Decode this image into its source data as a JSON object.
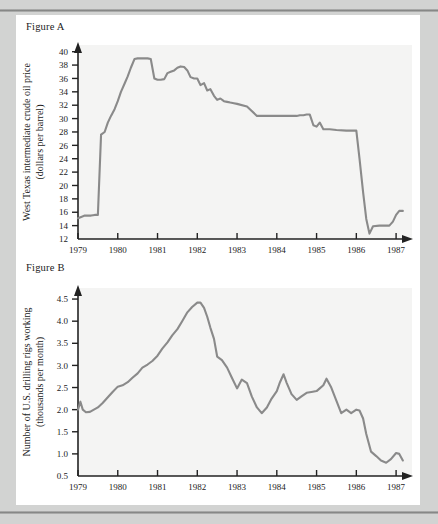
{
  "page": {
    "background_color": "#d2d3d2",
    "card_color": "#ffffff",
    "rule_color": "#8f908f"
  },
  "figures": [
    {
      "label": "Figure A",
      "ylabel_line1": "West Texas intermediate crude oil price",
      "ylabel_line2": "(dollars per barrel)"
    },
    {
      "label": "Figure B",
      "ylabel_line1": "Number of U.S. drilling rigs working",
      "ylabel_line2": "(thousands per month)"
    }
  ],
  "chart_data": [
    {
      "type": "line",
      "title": "Figure A",
      "xlabel": "",
      "ylabel": "West Texas intermediate crude oil price (dollars per barrel)",
      "series_color": "#8a8a8a",
      "grid": false,
      "legend": "none",
      "xlim": [
        1979.0,
        1987.4
      ],
      "ylim": [
        12,
        41
      ],
      "xticks": [
        "1979",
        "1980",
        "1981",
        "1982",
        "1983",
        "1984",
        "1985",
        "1986",
        "1987"
      ],
      "xtick_values": [
        1979,
        1980,
        1981,
        1982,
        1983,
        1984,
        1985,
        1986,
        1987
      ],
      "yticks": [
        "12",
        "14",
        "16",
        "18",
        "20",
        "22",
        "24",
        "26",
        "28",
        "30",
        "32",
        "34",
        "36",
        "38",
        "40"
      ],
      "ytick_values": [
        12,
        14,
        16,
        18,
        20,
        22,
        24,
        26,
        28,
        30,
        32,
        34,
        36,
        38,
        40
      ],
      "x": [
        1979.0,
        1979.08,
        1979.17,
        1979.25,
        1979.33,
        1979.42,
        1979.5,
        1979.58,
        1979.67,
        1979.75,
        1979.83,
        1979.92,
        1980.0,
        1980.08,
        1980.17,
        1980.25,
        1980.33,
        1980.42,
        1980.5,
        1980.58,
        1980.67,
        1980.75,
        1980.83,
        1980.92,
        1981.0,
        1981.08,
        1981.17,
        1981.25,
        1981.33,
        1981.42,
        1981.5,
        1981.58,
        1981.67,
        1981.75,
        1981.83,
        1981.92,
        1982.0,
        1982.08,
        1982.17,
        1982.25,
        1982.33,
        1982.42,
        1982.5,
        1982.58,
        1982.67,
        1982.75,
        1982.83,
        1982.92,
        1983.0,
        1983.25,
        1983.5,
        1983.75,
        1984.0,
        1984.25,
        1984.5,
        1984.58,
        1984.67,
        1984.75,
        1984.83,
        1984.92,
        1985.0,
        1985.08,
        1985.17,
        1985.33,
        1985.5,
        1985.75,
        1986.0,
        1986.08,
        1986.17,
        1986.25,
        1986.33,
        1986.42,
        1986.58,
        1986.75,
        1986.83,
        1986.92,
        1987.0,
        1987.08,
        1987.17
      ],
      "y": [
        15.1,
        15.3,
        15.5,
        15.5,
        15.5,
        15.6,
        15.6,
        27.6,
        28.0,
        29.4,
        30.4,
        31.4,
        32.6,
        34.0,
        35.2,
        36.3,
        37.6,
        38.9,
        39.0,
        39.0,
        39.0,
        39.0,
        38.9,
        36.0,
        35.8,
        35.8,
        35.9,
        36.8,
        37.0,
        37.2,
        37.6,
        37.8,
        37.7,
        37.2,
        36.2,
        36.0,
        36.0,
        35.0,
        35.3,
        34.2,
        34.4,
        33.4,
        32.8,
        33.0,
        32.6,
        32.5,
        32.4,
        32.3,
        32.2,
        31.8,
        30.4,
        30.4,
        30.4,
        30.4,
        30.4,
        30.5,
        30.5,
        30.6,
        30.6,
        29.0,
        28.8,
        29.4,
        28.4,
        28.4,
        28.3,
        28.2,
        28.2,
        24.0,
        19.0,
        15.0,
        12.8,
        13.9,
        14.0,
        14.0,
        14.0,
        14.6,
        15.6,
        16.2,
        16.2
      ]
    },
    {
      "type": "line",
      "title": "Figure B",
      "xlabel": "",
      "ylabel": "Number of U.S. drilling rigs working (thousands per month)",
      "series_color": "#8a8a8a",
      "grid": false,
      "legend": "none",
      "xlim": [
        1979.0,
        1987.4
      ],
      "ylim": [
        0.5,
        4.75
      ],
      "xticks": [
        "1979",
        "1980",
        "1981",
        "1982",
        "1983",
        "1984",
        "1985",
        "1986",
        "1987"
      ],
      "xtick_values": [
        1979,
        1980,
        1981,
        1982,
        1983,
        1984,
        1985,
        1986,
        1987
      ],
      "yticks": [
        "0.5",
        "1.0",
        "1.5",
        "2.0",
        "2.5",
        "3.0",
        "3.5",
        "4.0",
        "4.5"
      ],
      "ytick_values": [
        0.5,
        1.0,
        1.5,
        2.0,
        2.5,
        3.0,
        3.5,
        4.0,
        4.5
      ],
      "x": [
        1979.0,
        1979.06,
        1979.12,
        1979.2,
        1979.3,
        1979.4,
        1979.5,
        1979.62,
        1979.75,
        1979.87,
        1980.0,
        1980.12,
        1980.25,
        1980.37,
        1980.5,
        1980.62,
        1980.75,
        1980.87,
        1981.0,
        1981.12,
        1981.25,
        1981.37,
        1981.5,
        1981.62,
        1981.75,
        1981.87,
        1982.0,
        1982.08,
        1982.17,
        1982.25,
        1982.33,
        1982.42,
        1982.5,
        1982.62,
        1982.75,
        1982.87,
        1983.0,
        1983.12,
        1983.25,
        1983.37,
        1983.5,
        1983.62,
        1983.75,
        1983.87,
        1984.0,
        1984.08,
        1984.17,
        1984.25,
        1984.37,
        1984.5,
        1984.62,
        1984.75,
        1984.87,
        1985.0,
        1985.08,
        1985.17,
        1985.25,
        1985.37,
        1985.5,
        1985.62,
        1985.75,
        1985.87,
        1986.0,
        1986.08,
        1986.17,
        1986.25,
        1986.37,
        1986.5,
        1986.62,
        1986.75,
        1986.87,
        1987.0,
        1987.08,
        1987.17
      ],
      "y": [
        2.0,
        2.18,
        2.0,
        1.94,
        1.95,
        2.0,
        2.05,
        2.15,
        2.28,
        2.4,
        2.52,
        2.55,
        2.62,
        2.72,
        2.82,
        2.95,
        3.02,
        3.1,
        3.22,
        3.38,
        3.52,
        3.68,
        3.82,
        4.0,
        4.2,
        4.32,
        4.42,
        4.42,
        4.3,
        4.1,
        3.85,
        3.6,
        3.2,
        3.12,
        2.95,
        2.72,
        2.48,
        2.68,
        2.6,
        2.3,
        2.05,
        1.92,
        2.05,
        2.25,
        2.42,
        2.62,
        2.8,
        2.6,
        2.35,
        2.22,
        2.3,
        2.38,
        2.4,
        2.42,
        2.48,
        2.55,
        2.7,
        2.5,
        2.2,
        1.92,
        2.0,
        1.92,
        2.0,
        1.98,
        1.8,
        1.45,
        1.05,
        0.95,
        0.85,
        0.8,
        0.88,
        1.02,
        1.0,
        0.85
      ]
    }
  ]
}
